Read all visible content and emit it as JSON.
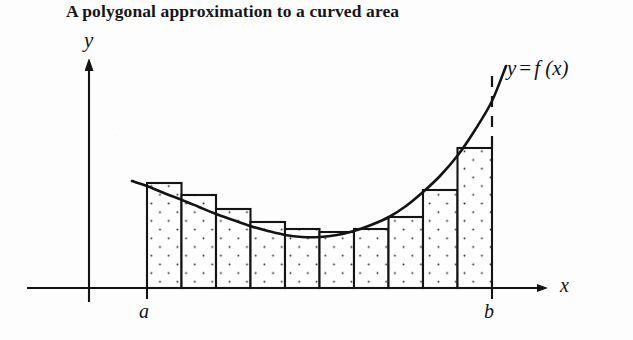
{
  "figure": {
    "title": "A polygonal approximation to a curved area",
    "labels": {
      "y_axis": "y",
      "x_axis": "x",
      "lower_limit": "a",
      "upper_limit": "b",
      "function_y": "y",
      "function_eq": "=",
      "function_fx": "f (x)"
    },
    "colors": {
      "ink": "#141414",
      "background": "#fdfdfd",
      "stipple": "#262626",
      "bar_fill": "#fefefe"
    }
  },
  "chart_data": {
    "type": "bar",
    "title": "A polygonal approximation to a curved area",
    "xlabel": "x",
    "ylabel": "y",
    "grid": false,
    "legend": null,
    "annotations": [
      "y = f (x)",
      "a",
      "b"
    ],
    "axis": {
      "x_axis_y_px": 288,
      "y_axis_x_px": 89,
      "x_axis_start_px": 27,
      "x_axis_arrow_tip_px": 550,
      "y_axis_arrow_tip_px": 57,
      "y_axis_base_px": 288
    },
    "interval": {
      "a_px": 147,
      "b_px": 492,
      "n_rectangles": 10,
      "bar_width_px": 34.5
    },
    "categories": [
      "1",
      "2",
      "3",
      "4",
      "5",
      "6",
      "7",
      "8",
      "9",
      "10"
    ],
    "bar_tops_px": [
      183,
      195,
      209,
      222,
      229,
      232,
      229,
      217,
      190,
      148
    ],
    "bar_heights_px": [
      105,
      93,
      79,
      66,
      59,
      56,
      59,
      71,
      98,
      140
    ],
    "values": [
      105,
      93,
      79,
      66,
      59,
      56,
      59,
      71,
      98,
      140
    ],
    "curve": {
      "label": "y = f (x)",
      "start_px": [
        132,
        181
      ],
      "end_px": [
        506,
        66
      ],
      "minimum_px": [
        305,
        238
      ],
      "points_px": [
        [
          132,
          181
        ],
        [
          147,
          186
        ],
        [
          164,
          193
        ],
        [
          182,
          200
        ],
        [
          199,
          207
        ],
        [
          216,
          214
        ],
        [
          233,
          220
        ],
        [
          250,
          226
        ],
        [
          268,
          231
        ],
        [
          285,
          235
        ],
        [
          302,
          237
        ],
        [
          320,
          237
        ],
        [
          337,
          235
        ],
        [
          354,
          231
        ],
        [
          371,
          225
        ],
        [
          389,
          217
        ],
        [
          406,
          206
        ],
        [
          423,
          192
        ],
        [
          440,
          176
        ],
        [
          458,
          155
        ],
        [
          475,
          130
        ],
        [
          492,
          101
        ],
        [
          506,
          66
        ]
      ]
    },
    "dashed_segment_px": {
      "x": 492,
      "y_top": 76,
      "y_bottom": 148
    },
    "ticks_px": [
      {
        "label": "a",
        "x": 147
      },
      {
        "label": "b",
        "x": 492
      }
    ]
  }
}
